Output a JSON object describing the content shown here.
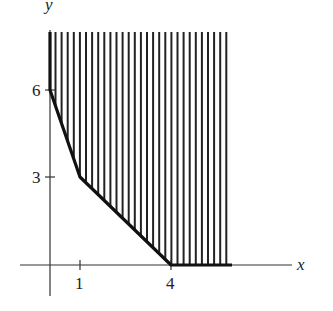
{
  "diagram": {
    "type": "feasible-region",
    "axes": {
      "x_label": "x",
      "y_label": "y",
      "x_ticks": [
        {
          "value": 1,
          "label": "1"
        },
        {
          "value": 4,
          "label": "4"
        }
      ],
      "y_ticks": [
        {
          "value": 3,
          "label": "3"
        },
        {
          "value": 6,
          "label": "6"
        }
      ]
    },
    "boundary_points": [
      [
        0,
        6
      ],
      [
        1,
        3
      ],
      [
        4,
        0
      ]
    ],
    "region": "unbounded region above/right of piecewise boundary, shaded with vertical hatching",
    "colors": {
      "ink": "#222222",
      "background": "#ffffff"
    }
  }
}
